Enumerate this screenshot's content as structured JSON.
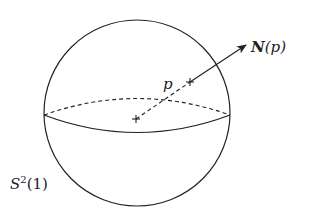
{
  "figure": {
    "sphere_label": {
      "symbol": "S",
      "superscript": "2",
      "argument": "(1)"
    },
    "point_label": "p",
    "normal_label": {
      "symbol": "N",
      "argument": "(p)"
    },
    "colors": {
      "stroke": "#222222",
      "background": "#ffffff"
    }
  }
}
